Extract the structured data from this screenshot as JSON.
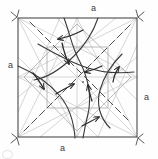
{
  "figure": {
    "type": "geometric-diagram",
    "canvas": {
      "width": 158,
      "height": 159
    },
    "square": {
      "name": "outer-square",
      "x": 18,
      "y": 18,
      "width": 119,
      "height": 119,
      "stroke": "#4a4a4a",
      "stroke_width": 1.1
    },
    "colors": {
      "construction_line": "#c8c8c8",
      "medium_line": "#9a9a9a",
      "square_edge": "#4a4a4a",
      "arrow_ink": "#2b2b2b",
      "dashed_fold": "#555555",
      "label_text": "#3a3a3a",
      "background": "#fefefe"
    },
    "labels": [
      {
        "id": "label-top",
        "text": "a",
        "side": "top"
      },
      {
        "id": "label-left",
        "text": "a",
        "side": "left"
      },
      {
        "id": "label-right",
        "text": "a",
        "side": "right"
      },
      {
        "id": "label-bottom",
        "text": "a",
        "side": "bottom"
      }
    ],
    "corner_marks": [
      {
        "id": "corner-mark-top-left",
        "x": 18,
        "y": 18
      },
      {
        "id": "corner-mark-top-right",
        "x": 137,
        "y": 18
      },
      {
        "id": "corner-mark-bottom-left",
        "x": 18,
        "y": 137
      },
      {
        "id": "corner-mark-bottom-right",
        "x": 137,
        "y": 137
      }
    ],
    "construction_lines": [
      {
        "x1": 18,
        "y1": 18,
        "x2": 137,
        "y2": 137,
        "weight": "light"
      },
      {
        "x1": 137,
        "y1": 18,
        "x2": 18,
        "y2": 137,
        "weight": "light"
      },
      {
        "x1": 77,
        "y1": 18,
        "x2": 77,
        "y2": 137,
        "weight": "light"
      },
      {
        "x1": 18,
        "y1": 77,
        "x2": 137,
        "y2": 77,
        "weight": "light"
      },
      {
        "x1": 18,
        "y1": 18,
        "x2": 77,
        "y2": 137,
        "weight": "light"
      },
      {
        "x1": 18,
        "y1": 18,
        "x2": 137,
        "y2": 77,
        "weight": "light"
      },
      {
        "x1": 137,
        "y1": 18,
        "x2": 77,
        "y2": 137,
        "weight": "light"
      },
      {
        "x1": 137,
        "y1": 18,
        "x2": 18,
        "y2": 77,
        "weight": "light"
      },
      {
        "x1": 18,
        "y1": 137,
        "x2": 77,
        "y2": 18,
        "weight": "light"
      },
      {
        "x1": 18,
        "y1": 137,
        "x2": 137,
        "y2": 77,
        "weight": "light"
      },
      {
        "x1": 137,
        "y1": 137,
        "x2": 77,
        "y2": 18,
        "weight": "light"
      },
      {
        "x1": 137,
        "y1": 137,
        "x2": 18,
        "y2": 77,
        "weight": "light"
      },
      {
        "x1": 18,
        "y1": 97,
        "x2": 116,
        "y2": 18,
        "weight": "light"
      },
      {
        "x1": 40,
        "y1": 137,
        "x2": 137,
        "y2": 57,
        "weight": "light"
      },
      {
        "x1": 18,
        "y1": 57,
        "x2": 98,
        "y2": 137,
        "weight": "light"
      },
      {
        "x1": 57,
        "y1": 18,
        "x2": 137,
        "y2": 100,
        "weight": "light"
      },
      {
        "x1": 47,
        "y1": 47,
        "x2": 108,
        "y2": 47,
        "weight": "medium"
      },
      {
        "x1": 108,
        "y1": 47,
        "x2": 108,
        "y2": 108,
        "weight": "medium"
      },
      {
        "x1": 108,
        "y1": 108,
        "x2": 47,
        "y2": 108,
        "weight": "medium"
      },
      {
        "x1": 47,
        "y1": 108,
        "x2": 47,
        "y2": 47,
        "weight": "medium"
      }
    ],
    "dashed_folds": [
      {
        "x1": 24,
        "y1": 131,
        "x2": 131,
        "y2": 24
      },
      {
        "x1": 30,
        "y1": 22,
        "x2": 128,
        "y2": 120
      }
    ],
    "fold_arrows": [
      {
        "id": "arrow-top-left-inward",
        "direction": "left",
        "tip_x": 55,
        "tip_y": 40
      },
      {
        "id": "arrow-top-center-down",
        "direction": "down-left",
        "tip_x": 68,
        "tip_y": 62
      },
      {
        "id": "arrow-upper-right-inward",
        "direction": "left",
        "tip_x": 83,
        "tip_y": 72
      },
      {
        "id": "arrow-right-up",
        "direction": "up",
        "tip_x": 119,
        "tip_y": 67
      },
      {
        "id": "arrow-left-down",
        "direction": "down",
        "tip_x": 44,
        "tip_y": 88
      },
      {
        "id": "arrow-lower-left-up",
        "direction": "up-right",
        "tip_x": 73,
        "tip_y": 84
      },
      {
        "id": "arrow-lower-center-up",
        "direction": "up",
        "tip_x": 87,
        "tip_y": 85
      },
      {
        "id": "arrow-bottom-right-out",
        "direction": "right",
        "tip_x": 98,
        "tip_y": 117
      }
    ],
    "center_point": {
      "x": 83,
      "y": 82
    }
  }
}
